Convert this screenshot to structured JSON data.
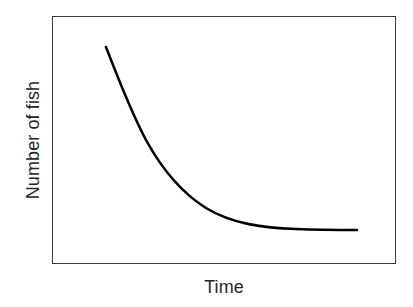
{
  "chart_data": {
    "type": "line",
    "title": "",
    "subtitle": "",
    "xlabel": "Time",
    "ylabel": "Number of fish",
    "grid": false,
    "legend": null,
    "legend_position": "none",
    "axis_ticks": {
      "x": [],
      "y": []
    },
    "xlim": [
      0,
      1
    ],
    "ylim": [
      0,
      1
    ],
    "annotations": [],
    "series": [
      {
        "name": "Number of fish over time",
        "shape": "exponential decay, steep initial drop levelling off to a low asymptote",
        "color": "#000000",
        "line_width": 2.6,
        "x": [
          0.16,
          0.22,
          0.28,
          0.34,
          0.4,
          0.46,
          0.52,
          0.58,
          0.64,
          0.7,
          0.76,
          0.82,
          0.88,
          0.94,
          1.0
        ],
        "y": [
          0.875,
          0.79,
          0.69,
          0.59,
          0.495,
          0.41,
          0.337,
          0.277,
          0.23,
          0.195,
          0.17,
          0.152,
          0.142,
          0.136,
          0.133
        ]
      }
    ],
    "curve_pixel_path": "M106,47 C118,78 131,112 146,140 C163,171 182,193 206,208 C232,224 264,228 296,229 C320,230 340,230 357,230"
  },
  "figure": {
    "background_color": "#ffffff",
    "frame_color": "#3a3a3a",
    "label_color": "#262626",
    "curve_color": "#000000"
  }
}
